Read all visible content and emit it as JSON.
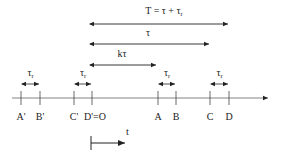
{
  "diagram": {
    "top_arrows": [
      {
        "label": "T = τ + τ",
        "sub": "r",
        "x1": 89,
        "x2": 229,
        "y": 24,
        "label_y": 14
      },
      {
        "label": "τ",
        "sub": "",
        "x1": 89,
        "x2": 210,
        "y": 44,
        "label_y": 36
      },
      {
        "label": "kτ",
        "sub": "",
        "x1": 89,
        "x2": 157,
        "y": 65,
        "label_y": 57
      }
    ],
    "interval_label": {
      "main": "τ",
      "sub": "r"
    },
    "intervals": [
      {
        "x1": 21,
        "x2": 40
      },
      {
        "x1": 74,
        "x2": 92
      },
      {
        "x1": 158,
        "x2": 176
      },
      {
        "x1": 210,
        "x2": 229
      }
    ],
    "ticks": [
      {
        "label": "A'",
        "x": 21
      },
      {
        "label": "B'",
        "x": 40
      },
      {
        "label": "C'",
        "x": 74
      },
      {
        "label": "D'=O",
        "x": 92
      },
      {
        "label": "A",
        "x": 158
      },
      {
        "label": "B",
        "x": 176
      },
      {
        "label": "C",
        "x": 210
      },
      {
        "label": "D",
        "x": 229
      }
    ],
    "axis": {
      "x1": 12,
      "x2": 268,
      "y": 98
    },
    "time_arrow": {
      "label": "t",
      "x1": 91,
      "x2": 125,
      "y": 143
    }
  }
}
